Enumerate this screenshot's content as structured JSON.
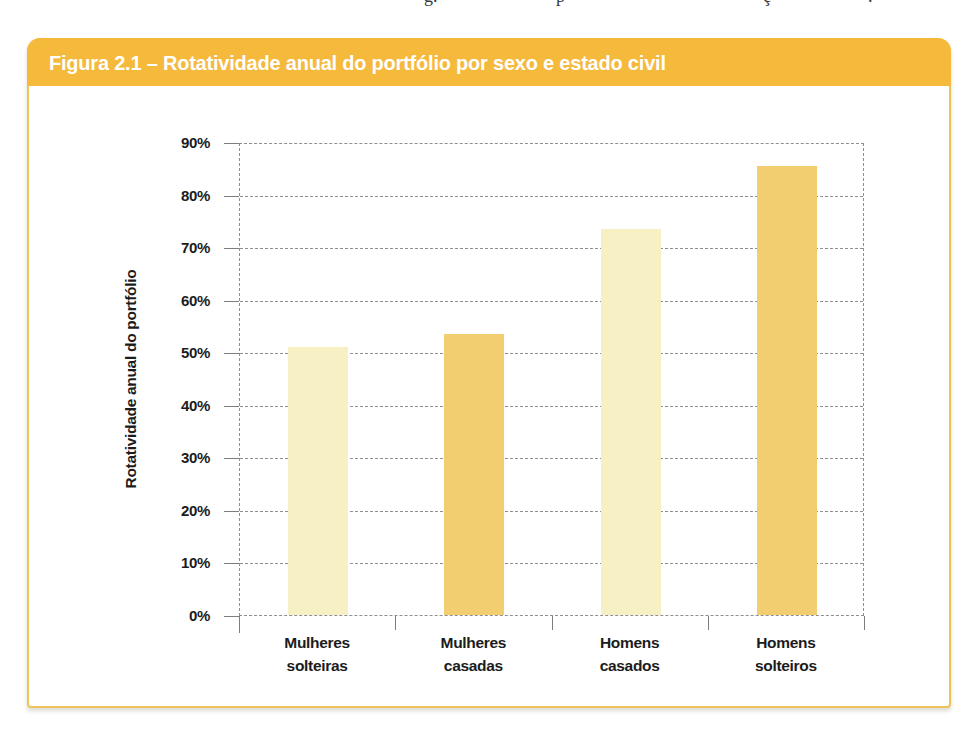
{
  "page": {
    "top_fragments": [
      {
        "char": "g.",
        "x": 424
      },
      {
        "char": "p",
        "x": 556
      },
      {
        "char": "ç",
        "x": 763
      },
      {
        "char": ".",
        "x": 868
      }
    ]
  },
  "figure": {
    "title": "Figura 2.1 – Rotatividade anual do portfólio por sexo e estado civil",
    "colors": {
      "header_bg": "#F5B93C",
      "card_border": "#ECC45B",
      "title_text": "#FFFFFF",
      "label_text": "#1C1C1C",
      "grid": "#8F8F8F",
      "bar_light": "#F8F0C5",
      "bar_dark": "#F2CE70"
    }
  },
  "chart_data": {
    "type": "bar",
    "title": "Figura 2.1 – Rotatividade anual do portfólio por sexo e estado civil",
    "categories": [
      "Mulheres\nsolteiras",
      "Mulheres\ncasadas",
      "Homens\ncasados",
      "Homens\nsolteiros"
    ],
    "values": [
      51,
      53.5,
      73.5,
      85.5
    ],
    "bar_colors": [
      "#F8F0C5",
      "#F2CE70",
      "#F8F0C5",
      "#F2CE70"
    ],
    "xlabel": "",
    "ylabel": "Rotatividade anual do portfólio",
    "ylim": [
      0,
      90
    ],
    "ytick_step": 10,
    "ytick_labels": [
      "0%",
      "10%",
      "20%",
      "30%",
      "40%",
      "50%",
      "60%",
      "70%",
      "80%",
      "90%"
    ],
    "grid": "horizontal-dashed-gray",
    "legend": "none",
    "bar_unit": "percent"
  }
}
